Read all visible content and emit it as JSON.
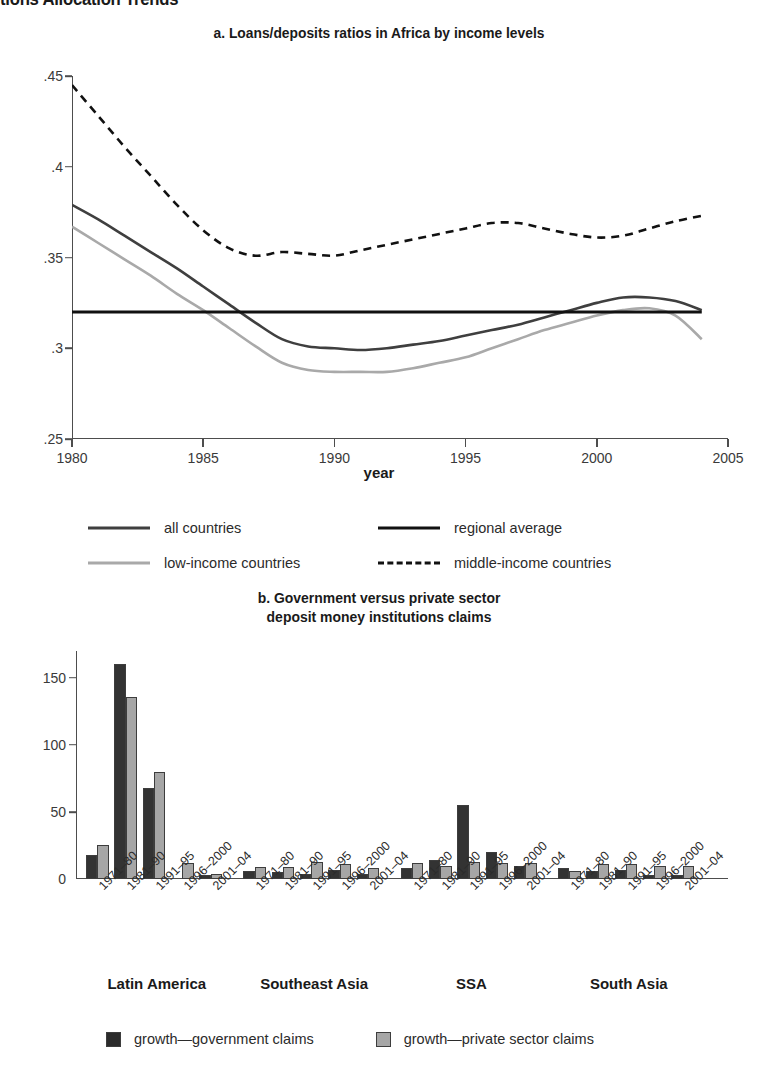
{
  "page": {
    "title": "tions Allocation Trends"
  },
  "panel_a": {
    "title": "a. Loans/deposits ratios in Africa by income levels",
    "xlabel": "year",
    "yticks": [
      ".25",
      ".3",
      ".35",
      ".4",
      ".45"
    ],
    "xticks": [
      "1980",
      "1985",
      "1990",
      "1995",
      "2000",
      "2005"
    ],
    "legend": [
      {
        "label": "all countries",
        "style": "solid",
        "color": "#3f3f3f"
      },
      {
        "label": "regional average",
        "style": "solid",
        "color": "#111111"
      },
      {
        "label": "low-income countries",
        "style": "solid",
        "color": "#a9a9a9"
      },
      {
        "label": "middle-income countries",
        "style": "dashed",
        "color": "#111111"
      }
    ]
  },
  "panel_b": {
    "title_line1": "b. Government versus private sector",
    "title_line2": "deposit money institutions claims",
    "yticks": [
      "0",
      "50",
      "100",
      "150"
    ],
    "period_labels": [
      "1971–80",
      "1981–90",
      "1991–95",
      "1996–2000",
      "2001–04"
    ],
    "regions": [
      "Latin America",
      "Southeast Asia",
      "SSA",
      "South Asia"
    ],
    "legend": [
      {
        "label": "growth—government claims",
        "color": "#2b2b2b"
      },
      {
        "label": "growth—private sector claims",
        "color": "#a6a6a6"
      }
    ]
  },
  "chart_data": [
    {
      "type": "line",
      "title": "a. Loans/deposits ratios in Africa by income levels",
      "xlabel": "year",
      "ylabel": "",
      "xlim": [
        1980,
        2005
      ],
      "ylim": [
        0.25,
        0.45
      ],
      "yticks": [
        0.25,
        0.3,
        0.35,
        0.4,
        0.45
      ],
      "xticks": [
        1980,
        1985,
        1990,
        1995,
        2000,
        2005
      ],
      "grid": false,
      "legend_position": "below",
      "x": [
        1980,
        1981,
        1982,
        1983,
        1984,
        1985,
        1986,
        1987,
        1988,
        1989,
        1990,
        1991,
        1992,
        1993,
        1994,
        1995,
        1996,
        1997,
        1998,
        1999,
        2000,
        2001,
        2002,
        2003,
        2004
      ],
      "series": [
        {
          "name": "all countries",
          "style": "solid",
          "color": "#3f3f3f",
          "values": [
            0.379,
            0.371,
            0.362,
            0.353,
            0.344,
            0.334,
            0.324,
            0.314,
            0.305,
            0.301,
            0.3,
            0.299,
            0.3,
            0.302,
            0.304,
            0.307,
            0.31,
            0.313,
            0.317,
            0.321,
            0.325,
            0.328,
            0.328,
            0.326,
            0.321
          ]
        },
        {
          "name": "low-income countries",
          "style": "solid",
          "color": "#a9a9a9",
          "values": [
            0.367,
            0.358,
            0.349,
            0.34,
            0.33,
            0.321,
            0.311,
            0.301,
            0.292,
            0.288,
            0.287,
            0.287,
            0.287,
            0.289,
            0.292,
            0.295,
            0.3,
            0.305,
            0.31,
            0.314,
            0.318,
            0.321,
            0.322,
            0.318,
            0.305
          ]
        },
        {
          "name": "regional average",
          "style": "solid",
          "color": "#111111",
          "values": [
            0.32,
            0.32,
            0.32,
            0.32,
            0.32,
            0.32,
            0.32,
            0.32,
            0.32,
            0.32,
            0.32,
            0.32,
            0.32,
            0.32,
            0.32,
            0.32,
            0.32,
            0.32,
            0.32,
            0.32,
            0.32,
            0.32,
            0.32,
            0.32,
            0.32
          ]
        },
        {
          "name": "middle-income countries",
          "style": "dashed",
          "color": "#111111",
          "values": [
            0.445,
            0.428,
            0.411,
            0.395,
            0.379,
            0.365,
            0.355,
            0.351,
            0.353,
            0.352,
            0.351,
            0.354,
            0.357,
            0.36,
            0.363,
            0.366,
            0.369,
            0.369,
            0.366,
            0.363,
            0.361,
            0.362,
            0.366,
            0.37,
            0.373
          ]
        }
      ]
    },
    {
      "type": "bar",
      "title": "b. Government versus private sector deposit money institutions claims",
      "xlabel": "",
      "ylabel": "",
      "ylim": [
        0,
        170
      ],
      "yticks": [
        0,
        50,
        100,
        150
      ],
      "grid": false,
      "legend_position": "below",
      "groups": [
        {
          "region": "Latin America",
          "categories": [
            "1971–80",
            "1981–90",
            "1991–95",
            "1996–2000",
            "2001–04"
          ],
          "series": [
            {
              "name": "growth—government claims",
              "values": [
                18,
                160,
                68,
                0,
                3
              ]
            },
            {
              "name": "growth—private sector claims",
              "values": [
                25,
                136,
                80,
                12,
                4
              ]
            }
          ]
        },
        {
          "region": "Southeast Asia",
          "categories": [
            "1971–80",
            "1981–90",
            "1991–95",
            "1996–2000",
            "2001–04"
          ],
          "series": [
            {
              "name": "growth—government claims",
              "values": [
                6,
                5,
                4,
                7,
                4
              ]
            },
            {
              "name": "growth—private sector claims",
              "values": [
                9,
                9,
                13,
                11,
                8
              ]
            }
          ]
        },
        {
          "region": "SSA",
          "categories": [
            "1971–80",
            "1981–90",
            "1991–95",
            "1996–2000",
            "2001–04"
          ],
          "series": [
            {
              "name": "growth—government claims",
              "values": [
                8,
                14,
                55,
                20,
                10
              ]
            },
            {
              "name": "growth—private sector claims",
              "values": [
                12,
                10,
                13,
                12,
                12
              ]
            }
          ]
        },
        {
          "region": "South Asia",
          "categories": [
            "1971–80",
            "1981–90",
            "1991–95",
            "1996–2000",
            "2001–04"
          ],
          "series": [
            {
              "name": "growth—government claims",
              "values": [
                8,
                6,
                7,
                3,
                3
              ]
            },
            {
              "name": "growth—private sector claims",
              "values": [
                6,
                11,
                11,
                10,
                10
              ]
            }
          ]
        }
      ]
    }
  ]
}
